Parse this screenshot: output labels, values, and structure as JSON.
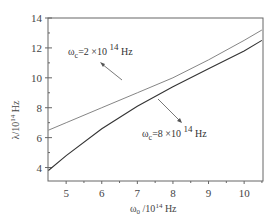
{
  "chart_data": {
    "type": "line",
    "title": "",
    "xlabel": "ω0 /10^14 Hz",
    "ylabel": "λ/10^14 Hz",
    "xlim": [
      4.5,
      10.5
    ],
    "ylim": [
      3,
      14
    ],
    "xticks": [
      5,
      6,
      7,
      8,
      9,
      10
    ],
    "yticks": [
      4,
      6,
      8,
      10,
      12,
      14
    ],
    "grid": false,
    "legend": "annotations with arrows",
    "series": [
      {
        "name": "ωc=2×10^14 Hz",
        "x": [
          4.5,
          5,
          6,
          7,
          8,
          9,
          10,
          10.5
        ],
        "y": [
          6.5,
          7.0,
          8.0,
          9.0,
          10.0,
          11.2,
          12.5,
          13.2
        ]
      },
      {
        "name": "ωc=8×10^14 Hz",
        "x": [
          4.5,
          5,
          6,
          7,
          8,
          9,
          10,
          10.5
        ],
        "y": [
          3.8,
          4.8,
          6.6,
          8.1,
          9.4,
          10.6,
          11.8,
          12.5
        ]
      }
    ]
  },
  "axes": {
    "x_title_main": "ω",
    "x_title_sub": "0",
    "x_title_rest": " /10",
    "x_title_sup": "14",
    "x_title_unit": " Hz",
    "y_title": "λ/10",
    "y_title_sup": "14",
    "y_title_unit": " Hz",
    "x_tick_labels": [
      "5",
      "6",
      "7",
      "8",
      "9",
      "10"
    ],
    "y_tick_labels": [
      "4",
      "6",
      "8",
      "10",
      "12",
      "14"
    ]
  },
  "annotations": {
    "upper": {
      "main": "ω",
      "sub": "c",
      "rest": "=2 ×10 ",
      "sup": "14",
      "unit": " Hz"
    },
    "lower": {
      "main": "ω",
      "sub": "c",
      "rest": "=8 ×10 ",
      "sup": "14",
      "unit": " Hz"
    }
  }
}
